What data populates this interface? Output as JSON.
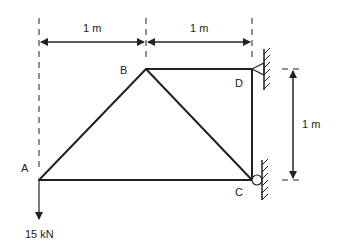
{
  "diagram": {
    "type": "truss",
    "nodes": {
      "A": {
        "label": "A"
      },
      "B": {
        "label": "B"
      },
      "C": {
        "label": "C"
      },
      "D": {
        "label": "D"
      }
    },
    "members": [
      "A-B",
      "B-D",
      "B-C",
      "D-C",
      "A-C"
    ],
    "supports": [
      {
        "node": "D",
        "type": "pin",
        "label": ""
      },
      {
        "node": "C",
        "type": "roller",
        "label": ""
      }
    ],
    "load": {
      "node": "A",
      "value": "15 kN",
      "direction": "down"
    },
    "dimensions": {
      "top_left": "1 m",
      "top_right": "1 m",
      "right_vertical": "1 m"
    },
    "colors": {
      "line": "#222222",
      "background": "#ffffff"
    }
  }
}
